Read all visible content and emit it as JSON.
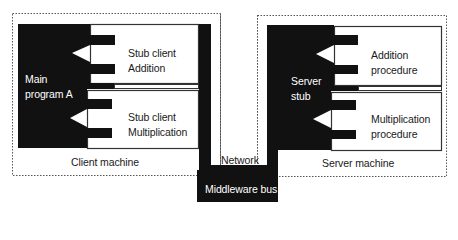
{
  "diagram": {
    "type": "rpc-middleware-architecture",
    "colors": {
      "block": "#111111",
      "box_border": "#333333",
      "dashed_border": "#555555",
      "background": "#ffffff",
      "text": "#1a1a1a",
      "text_inverse": "#ffffff"
    },
    "client": {
      "machine_label": "Client machine",
      "main_program": {
        "line1": "Main",
        "line2": "program A"
      },
      "stubs": [
        {
          "line1": "Stub client",
          "line2": "Addition"
        },
        {
          "line1": "Stub client",
          "line2": "Multiplication"
        }
      ]
    },
    "server": {
      "machine_label": "Server machine",
      "server_stub": {
        "line1": "Server",
        "line2": "stub"
      },
      "procedures": [
        {
          "line1": "Addition",
          "line2": "procedure"
        },
        {
          "line1": "Multiplication",
          "line2": "procedure"
        }
      ]
    },
    "network_label": "Network",
    "middleware_label": "Middleware bus"
  }
}
